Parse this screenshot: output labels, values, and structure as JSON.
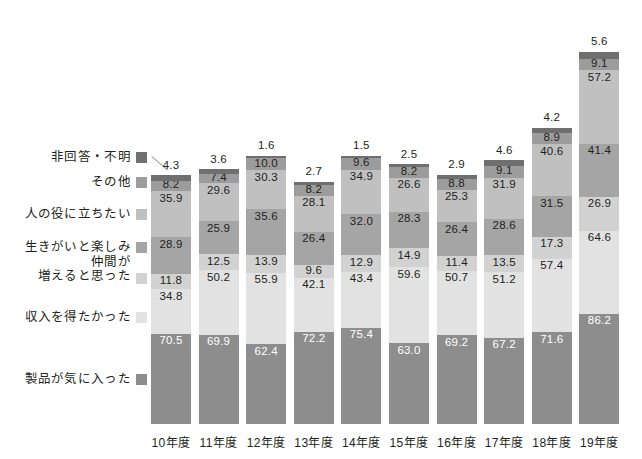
{
  "chart_data": {
    "type": "bar",
    "title": "",
    "subtitle": "",
    "xlabel": "",
    "ylabel": "",
    "stacked": true,
    "note": "Multiple-response survey: stacked segment values are percentages that sum above 100.",
    "grid": false,
    "legend_position": "left",
    "categories": [
      "10年度",
      "11年度",
      "12年度",
      "13年度",
      "14年度",
      "15年度",
      "16年度",
      "17年度",
      "18年度",
      "19年度"
    ],
    "series": [
      {
        "name": "製品が気に入った",
        "color": "#8d8d8d",
        "label_color": "#ffffff",
        "values": [
          70.5,
          69.9,
          62.4,
          72.2,
          75.4,
          63.0,
          69.2,
          67.2,
          71.6,
          86.2
        ]
      },
      {
        "name": "収入を得たかった",
        "color": "#e2e2e2",
        "label_color": "#231f20",
        "values": [
          34.8,
          50.2,
          55.9,
          42.1,
          43.4,
          59.6,
          50.7,
          51.2,
          57.4,
          64.6
        ]
      },
      {
        "name": "仲間が\n増えると思った",
        "color": "#d2d2d2",
        "label_color": "#231f20",
        "values": [
          11.8,
          12.5,
          13.9,
          9.6,
          12.9,
          14.9,
          11.4,
          13.5,
          17.3,
          26.9
        ]
      },
      {
        "name": "生きがいと楽しみ",
        "color": "#a5a5a5",
        "label_color": "#231f20",
        "values": [
          28.9,
          25.9,
          35.6,
          26.4,
          32.0,
          28.3,
          26.4,
          28.6,
          31.5,
          41.4
        ]
      },
      {
        "name": "人の役に立ちたい",
        "color": "#c0c0c0",
        "label_color": "#231f20",
        "values": [
          35.9,
          29.6,
          30.3,
          28.1,
          34.9,
          26.6,
          25.3,
          31.9,
          40.6,
          57.2
        ]
      },
      {
        "name": "その他",
        "color": "#9c9c9c",
        "label_color": "#231f20",
        "values": [
          8.2,
          7.4,
          10.0,
          8.2,
          9.6,
          8.2,
          8.8,
          9.1,
          8.9,
          9.1
        ]
      },
      {
        "name": "非回答・不明",
        "color": "#6f6f6f",
        "label_color": "#231f20",
        "values": [
          4.3,
          3.6,
          1.6,
          2.7,
          1.5,
          2.5,
          2.9,
          4.6,
          4.2,
          5.6
        ]
      }
    ]
  },
  "legend": {
    "items": [
      {
        "label": "非回答・不明",
        "color": "#6f6f6f"
      },
      {
        "label": "その他",
        "color": "#9c9c9c"
      },
      {
        "label": "人の役に立ちたい",
        "color": "#c0c0c0"
      },
      {
        "label": "生きがいと楽しみ",
        "color": "#a5a5a5"
      },
      {
        "label": "仲間が",
        "label2": "増えると思った",
        "color": "#d2d2d2"
      },
      {
        "label": "収入を得たかった",
        "color": "#e2e2e2"
      },
      {
        "label": "製品が気に入った",
        "color": "#8d8d8d"
      }
    ]
  }
}
